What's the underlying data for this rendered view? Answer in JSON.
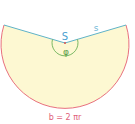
{
  "diagram": {
    "labels": {
      "apex": "S",
      "slant": "s",
      "angle": "φ",
      "arc_length": "b = 2 πr"
    },
    "colors": {
      "fill": "#fdf8d2",
      "arc": "#e8707e",
      "radius_lines": "#5fb3c8",
      "apex_label": "#4a9fd0",
      "angle_arc": "#79b863",
      "angle_label": "#5a9c48",
      "apex_point": "#d9534f",
      "arc_label": "#e0607a"
    }
  }
}
